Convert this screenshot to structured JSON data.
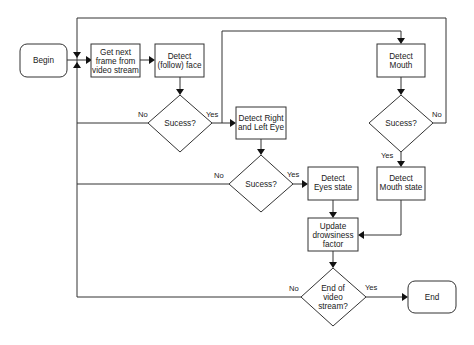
{
  "diagram": {
    "type": "flowchart",
    "nodes": {
      "begin": {
        "label": "Begin",
        "shape": "rounded-rect"
      },
      "get_frame": {
        "lines": [
          "Get next",
          "frame from",
          "video stream"
        ],
        "shape": "rect"
      },
      "detect_face": {
        "lines": [
          "Detect",
          "(follow) face"
        ],
        "shape": "rect"
      },
      "face_success": {
        "label": "Sucess?",
        "shape": "diamond"
      },
      "detect_eyes": {
        "lines": [
          "Detect Right",
          "and Left Eye"
        ],
        "shape": "rect"
      },
      "eyes_success": {
        "label": "Sucess?",
        "shape": "diamond"
      },
      "detect_eyes_state": {
        "lines": [
          "Detect",
          "Eyes state"
        ],
        "shape": "rect"
      },
      "detect_mouth": {
        "lines": [
          "Detect",
          "Mouth"
        ],
        "shape": "rect"
      },
      "mouth_success": {
        "label": "Sucess?",
        "shape": "diamond"
      },
      "detect_mouth_state": {
        "lines": [
          "Detect",
          "Mouth state"
        ],
        "shape": "rect"
      },
      "update_drowsiness": {
        "lines": [
          "Update",
          "drowsiness",
          "factor"
        ],
        "shape": "rect"
      },
      "end_of_stream": {
        "lines": [
          "End of",
          "video",
          "stream?"
        ],
        "shape": "diamond"
      },
      "end": {
        "label": "End",
        "shape": "rounded-rect"
      }
    },
    "edge_labels": {
      "face_no": "No",
      "face_yes": "Yes",
      "eyes_no": "No",
      "eyes_yes": "Yes",
      "mouth_no": "No",
      "mouth_yes": "Yes",
      "stream_no": "No",
      "stream_yes": "Yes"
    },
    "edges": [
      {
        "from": "begin",
        "to": "get_frame"
      },
      {
        "from": "get_frame",
        "to": "detect_face"
      },
      {
        "from": "detect_face",
        "to": "face_success"
      },
      {
        "from": "face_success",
        "to": "detect_eyes",
        "label": "Yes"
      },
      {
        "from": "face_success",
        "to": "detect_mouth",
        "label": "Yes"
      },
      {
        "from": "face_success",
        "to": "get_frame",
        "label": "No"
      },
      {
        "from": "detect_eyes",
        "to": "eyes_success"
      },
      {
        "from": "eyes_success",
        "to": "detect_eyes_state",
        "label": "Yes"
      },
      {
        "from": "eyes_success",
        "to": "get_frame",
        "label": "No"
      },
      {
        "from": "detect_mouth",
        "to": "mouth_success"
      },
      {
        "from": "mouth_success",
        "to": "detect_mouth_state",
        "label": "Yes"
      },
      {
        "from": "mouth_success",
        "to": "get_frame",
        "label": "No"
      },
      {
        "from": "detect_eyes_state",
        "to": "update_drowsiness"
      },
      {
        "from": "detect_mouth_state",
        "to": "update_drowsiness"
      },
      {
        "from": "update_drowsiness",
        "to": "end_of_stream"
      },
      {
        "from": "end_of_stream",
        "to": "end",
        "label": "Yes"
      },
      {
        "from": "end_of_stream",
        "to": "get_frame",
        "label": "No"
      }
    ]
  }
}
